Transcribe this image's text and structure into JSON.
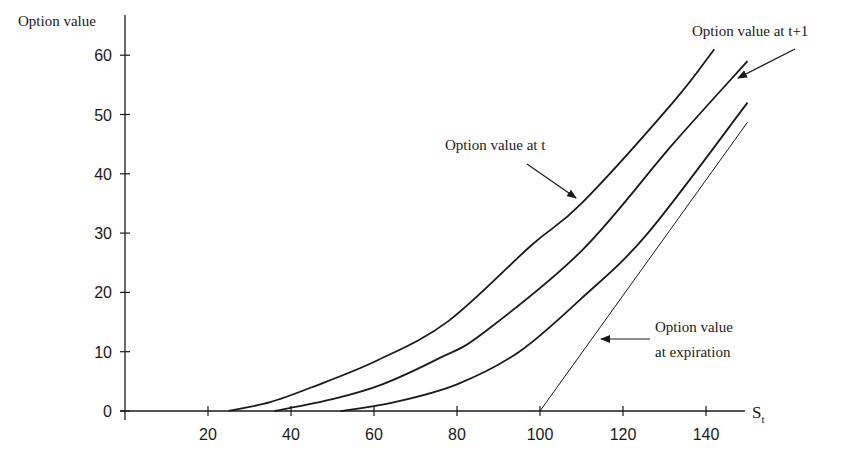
{
  "chart_data": {
    "type": "line",
    "title": "",
    "xlabel": "S_t",
    "xlabel_main": "S",
    "xlabel_sub": "t",
    "ylabel": "Option value",
    "xlim": [
      0,
      150
    ],
    "ylim": [
      0,
      62
    ],
    "x_ticks": [
      20,
      40,
      60,
      80,
      100,
      120,
      140
    ],
    "y_ticks": [
      0,
      10,
      20,
      30,
      40,
      50,
      60
    ],
    "grid": false,
    "legend": "none (annotations with arrows)",
    "series": [
      {
        "name": "Option value at t",
        "points": [
          [
            0,
            0
          ],
          [
            25,
            0
          ],
          [
            35,
            1.5
          ],
          [
            45,
            4
          ],
          [
            61,
            8.6
          ],
          [
            78,
            15.2
          ],
          [
            98,
            28
          ],
          [
            110,
            35
          ],
          [
            132,
            52
          ],
          [
            142,
            61
          ]
        ]
      },
      {
        "name": "Option value at t+1",
        "points": [
          [
            0,
            0
          ],
          [
            36,
            0
          ],
          [
            50,
            2
          ],
          [
            62,
            4.5
          ],
          [
            76,
            9
          ],
          [
            86,
            13
          ],
          [
            110,
            27
          ],
          [
            132,
            45
          ],
          [
            150,
            59
          ]
        ]
      },
      {
        "name": "Option value (intermediate)",
        "points": [
          [
            0,
            0
          ],
          [
            52,
            0
          ],
          [
            65,
            1.5
          ],
          [
            80,
            4.5
          ],
          [
            95,
            10
          ],
          [
            110,
            19
          ],
          [
            126,
            30
          ],
          [
            150,
            52
          ]
        ]
      },
      {
        "name": "Option value at expiration",
        "points": [
          [
            0,
            0
          ],
          [
            100,
            0
          ],
          [
            150,
            48.7
          ]
        ]
      }
    ],
    "annotations": [
      {
        "text": "Option value at t",
        "target_series": "Option value at t"
      },
      {
        "text": "Option value at t+1",
        "target_series": "Option value at t+1"
      },
      {
        "text": "Option value at expiration",
        "lines": [
          "Option value",
          "at expiration"
        ],
        "target_series": "Option value at expiration"
      }
    ]
  },
  "labels": {
    "y_axis": "Option value",
    "x_axis_main": "S",
    "x_axis_sub": "t",
    "ann_t": "Option value at t",
    "ann_t1": "Option value at t+1",
    "ann_exp_line1": "Option value",
    "ann_exp_line2": "at expiration"
  }
}
